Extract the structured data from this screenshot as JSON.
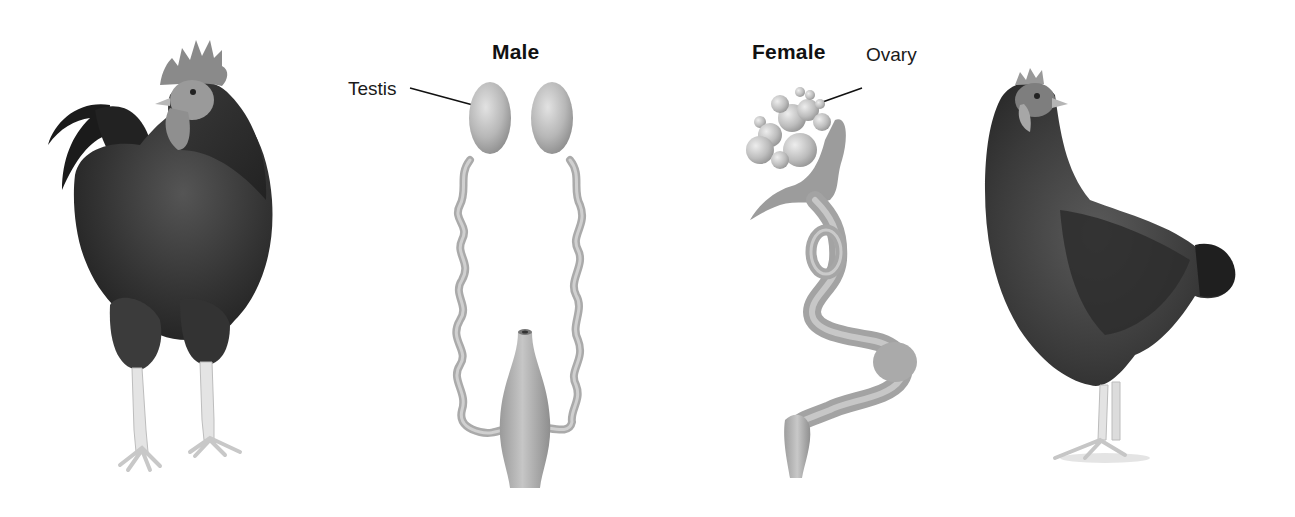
{
  "figure": {
    "male": {
      "heading": "Male",
      "labels": {
        "testis": "Testis"
      }
    },
    "female": {
      "heading": "Female",
      "labels": {
        "ovary": "Ovary"
      }
    },
    "images": {
      "rooster": "rooster-photo",
      "hen": "hen-photo"
    },
    "colors": {
      "organ_fill": "#a9a9a9",
      "organ_dark": "#7d7d7d",
      "organ_light": "#d4d4d4",
      "bird_dark": "#2a2a2a",
      "bird_mid": "#4a4a4a",
      "leg": "#e2e2e2",
      "text": "#111111"
    }
  }
}
